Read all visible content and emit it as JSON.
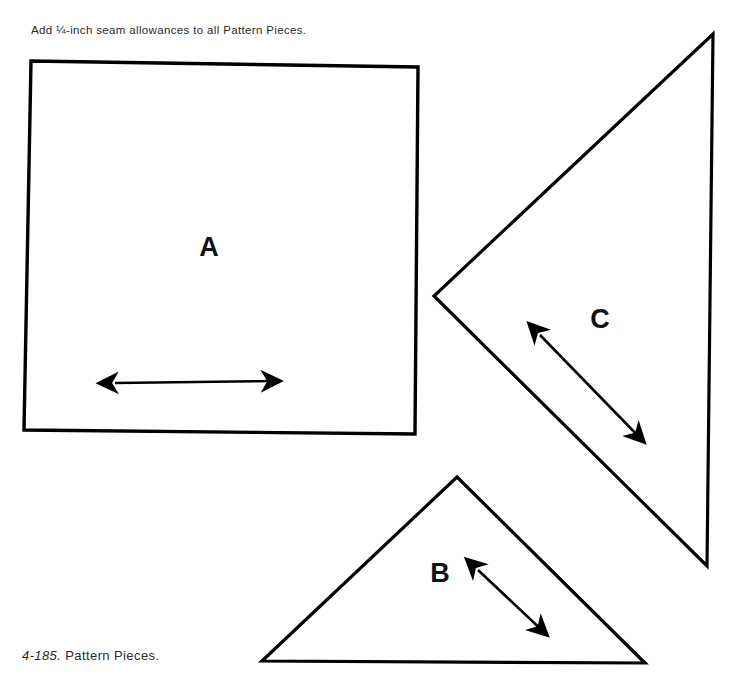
{
  "figure": {
    "instruction_note": "Add ¼-inch seam allowances to all Pattern Pieces.",
    "caption_number": "4-185.",
    "caption_text": " Pattern Pieces.",
    "ink_color": "#000000",
    "background_color": "#ffffff"
  },
  "pieces": [
    {
      "id": "A",
      "label": "A",
      "shape": "square",
      "grainline": "horizontal double-headed arrow",
      "outline_points": "31,61 418,67 415,434 24,430"
    },
    {
      "id": "B",
      "label": "B",
      "shape": "triangle",
      "grainline": "diagonal double-headed arrow",
      "outline_points": "457,477 645,663 262,661"
    },
    {
      "id": "C",
      "label": "C",
      "shape": "triangle",
      "grainline": "diagonal double-headed arrow",
      "outline_points": "713,34 707,566 434,296"
    }
  ],
  "arrows": [
    {
      "id": "arrow-a",
      "piece": "A",
      "from": "112,383",
      "to": "283,381"
    },
    {
      "id": "arrow-b",
      "piece": "B",
      "from": "476,568",
      "to": "549,637"
    },
    {
      "id": "arrow-c",
      "piece": "C",
      "from": "538,333",
      "to": "646,444"
    }
  ]
}
